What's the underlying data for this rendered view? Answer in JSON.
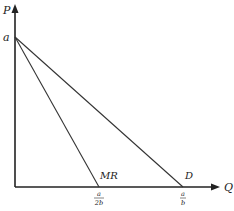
{
  "diagram": {
    "type": "monopoly demand and marginal revenue",
    "axes": {
      "y_label": "P",
      "x_label": "Q",
      "y_intercept_label": "a"
    },
    "curves": [
      {
        "name": "MR",
        "label": "MR",
        "x_intercept_num": "a",
        "x_intercept_den": "2b"
      },
      {
        "name": "D",
        "label": "D",
        "x_intercept_num": "a",
        "x_intercept_den": "b"
      }
    ],
    "colors": {
      "line": "#333333",
      "axis": "#222222"
    }
  }
}
